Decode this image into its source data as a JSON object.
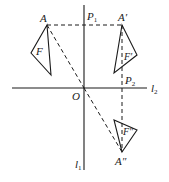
{
  "figure": {
    "type": "geometry-diagram",
    "colors": {
      "stroke": "#1a1a1a",
      "background": "#ffffff"
    }
  },
  "labels": {
    "A": "A",
    "A_prime": "A′",
    "A_double_prime": "A″",
    "F": "F",
    "F_prime": "F′",
    "F_double_prime": "F″",
    "O": "O",
    "P1": "P",
    "P1_sub": "1",
    "P2": "P",
    "P2_sub": "2",
    "l1": "l",
    "l1_sub": "1",
    "l2": "l",
    "l2_sub": "2"
  },
  "points": {
    "A": [
      47,
      25
    ],
    "A_prime": [
      122,
      25
    ],
    "A_double_prime": [
      122,
      152
    ],
    "O": [
      84,
      88
    ],
    "P1": [
      84,
      25
    ],
    "P2": [
      122,
      88
    ]
  },
  "lines": {
    "l1": {
      "from": [
        84,
        5
      ],
      "to": [
        84,
        170
      ],
      "style": "solid"
    },
    "l2": {
      "from": [
        12,
        88
      ],
      "to": [
        147,
        88
      ],
      "style": "solid"
    }
  },
  "triangles": {
    "F": [
      [
        47,
        25
      ],
      [
        31,
        53
      ],
      [
        51,
        75
      ]
    ],
    "F_prime": [
      [
        122,
        25
      ],
      [
        137,
        55
      ],
      [
        114,
        73
      ]
    ],
    "F_double_prime": [
      [
        122,
        152
      ],
      [
        137,
        130
      ],
      [
        114,
        120
      ]
    ]
  },
  "dashed_segments": [
    {
      "name": "A-to-A-prime",
      "from": [
        47,
        25
      ],
      "to": [
        122,
        25
      ]
    },
    {
      "name": "A-to-O",
      "from": [
        47,
        25
      ],
      "to": [
        84,
        88
      ]
    },
    {
      "name": "O-to-A-double-prime",
      "from": [
        84,
        88
      ],
      "to": [
        122,
        152
      ]
    },
    {
      "name": "A-prime-to-A-double-prime",
      "from": [
        122,
        25
      ],
      "to": [
        122,
        152
      ]
    }
  ]
}
